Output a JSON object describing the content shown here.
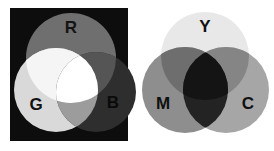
{
  "figure": {
    "background_color": "#ffffff",
    "width": 274,
    "height": 151
  },
  "panels": [
    {
      "id": "additive",
      "name": "additive-color-mixing-panel",
      "caption": "Additive primaries on black background",
      "background_color": "#0d0d0d",
      "frame": {
        "x": 10,
        "y": 8,
        "width": 118,
        "height": 133
      },
      "label_color": "#111111",
      "circles": [
        {
          "id": "R",
          "label": "R",
          "name": "circle-red",
          "full_name": "Red",
          "cx": 71,
          "cy": 58,
          "r": 45,
          "fill": "#6f6f6f",
          "label_x": 71,
          "label_y": 29,
          "label_color": "#141414"
        },
        {
          "id": "G",
          "label": "G",
          "name": "circle-green",
          "full_name": "Green",
          "cx": 56,
          "cy": 90,
          "r": 42,
          "fill": "#d9d9d9",
          "label_x": 36,
          "label_y": 106,
          "label_color": "#111111"
        },
        {
          "id": "B",
          "label": "B",
          "name": "circle-blue",
          "full_name": "Blue",
          "cx": 96,
          "cy": 92,
          "r": 40,
          "fill": "#2e2e2e",
          "label_x": 113,
          "label_y": 104,
          "label_color": "#0a0a0a"
        }
      ],
      "overlaps": [
        {
          "id": "RG",
          "name": "overlap-red-green",
          "result": "Yellow",
          "fill": "#f5f5f5"
        },
        {
          "id": "RB",
          "name": "overlap-red-blue",
          "result": "Magenta",
          "fill": "#555555"
        },
        {
          "id": "GB",
          "name": "overlap-green-blue",
          "result": "Cyan",
          "fill": "#9c9c9c"
        },
        {
          "id": "RGB",
          "name": "overlap-red-green-blue",
          "result": "White",
          "fill": "#ffffff"
        }
      ]
    },
    {
      "id": "subtractive",
      "name": "subtractive-color-mixing-panel",
      "caption": "Subtractive primaries on white background",
      "background_color": "#ffffff",
      "frame": {
        "x": 137,
        "y": 8,
        "width": 137,
        "height": 133
      },
      "label_color": "#111111",
      "circles": [
        {
          "id": "Y",
          "label": "Y",
          "name": "circle-yellow",
          "full_name": "Yellow",
          "cx": 205,
          "cy": 56,
          "r": 44,
          "fill": "#e8e8e8",
          "label_x": 205,
          "label_y": 28,
          "label_color": "#111111"
        },
        {
          "id": "M",
          "label": "M",
          "name": "circle-magenta",
          "full_name": "Magenta",
          "cx": 185,
          "cy": 90,
          "r": 43,
          "fill": "#8e8e8e",
          "label_x": 163,
          "label_y": 105,
          "label_color": "#101010"
        },
        {
          "id": "C",
          "label": "C",
          "name": "circle-cyan",
          "full_name": "Cyan",
          "cx": 226,
          "cy": 90,
          "r": 43,
          "fill": "#a6a6a6",
          "label_x": 248,
          "label_y": 105,
          "label_color": "#101010"
        }
      ],
      "overlaps": [
        {
          "id": "YM",
          "name": "overlap-yellow-magenta",
          "result": "Red",
          "fill": "#6e6e6e"
        },
        {
          "id": "YC",
          "name": "overlap-yellow-cyan",
          "result": "Green",
          "fill": "#858585"
        },
        {
          "id": "MC",
          "name": "overlap-magenta-cyan",
          "result": "Blue",
          "fill": "#232323"
        },
        {
          "id": "YMC",
          "name": "overlap-yellow-magenta-cyan",
          "result": "Black",
          "fill": "#141414"
        }
      ]
    }
  ]
}
